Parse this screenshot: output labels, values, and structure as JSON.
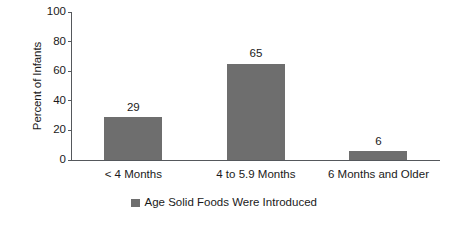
{
  "chart_data": {
    "type": "bar",
    "title": "",
    "subtitle": "",
    "categories": [
      "< 4 Months",
      "4 to 5.9 Months",
      "6 Months and Older"
    ],
    "values": [
      29,
      65,
      6
    ],
    "data_labels": [
      "29",
      "65",
      "6"
    ],
    "xlabel": "",
    "ylabel": "Percent of Infants",
    "ylim": [
      0,
      100
    ],
    "yticks": [
      0,
      20,
      40,
      60,
      80,
      100
    ],
    "ytick_labels": [
      "0",
      "20",
      "40",
      "60",
      "80",
      "100"
    ],
    "grid": false,
    "legend": {
      "position": "bottom-center",
      "entries": [
        {
          "label": "Age Solid Foods Were Introduced",
          "color": "#6e6e6e",
          "marker": "square"
        }
      ]
    },
    "series": [
      {
        "name": "Age Solid Foods Were Introduced",
        "color": "#6e6e6e",
        "values": [
          29,
          65,
          6
        ]
      }
    ],
    "colors": {
      "bar": "#6e6e6e",
      "axis": "#55585c",
      "text": "#1a1a1a",
      "background": "#ffffff"
    }
  }
}
